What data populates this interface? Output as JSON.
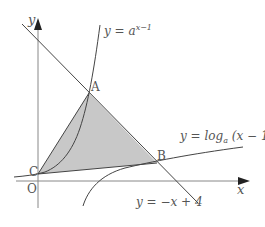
{
  "diagram": {
    "type": "function-graph",
    "axes": {
      "x_label": "x",
      "y_label": "y",
      "origin_label": "O"
    },
    "curves": [
      {
        "id": "exp",
        "label": "y = a^{x-1}",
        "label_base": "y = a",
        "label_exp": "x−1"
      },
      {
        "id": "log",
        "label": "y = log_a (x − 1)",
        "label_pre": "y = log",
        "label_sub": "a",
        "label_post": " (x − 1)"
      },
      {
        "id": "line",
        "label": "y = −x + 4"
      }
    ],
    "points": {
      "A": "A",
      "B": "B",
      "C": "C"
    },
    "shaded_region": "triangle ABC",
    "colors": {
      "line": "#444444",
      "axis": "#888888",
      "fill": "#c8c8c8",
      "text": "#555555"
    }
  }
}
